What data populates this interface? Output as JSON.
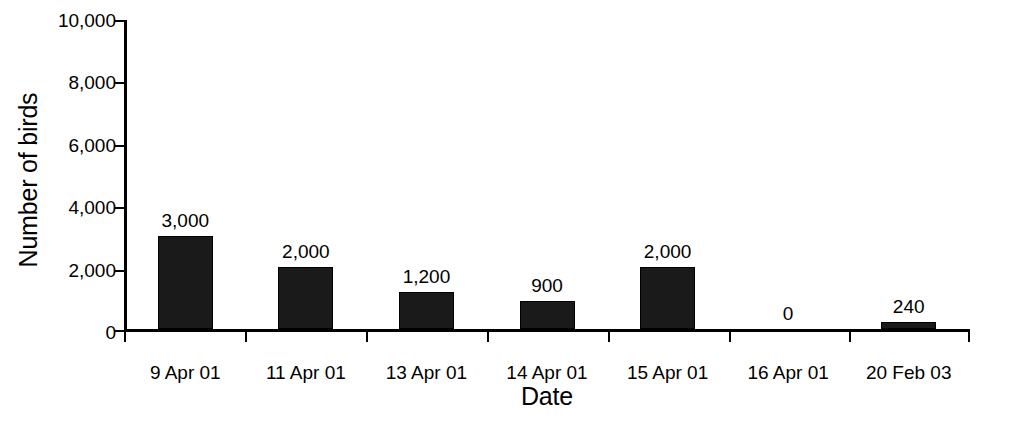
{
  "chart_data": {
    "type": "bar",
    "title": "",
    "xlabel": "Date",
    "ylabel": "Number of birds",
    "categories": [
      "9 Apr 01",
      "11 Apr 01",
      "13 Apr 01",
      "14 Apr 01",
      "15 Apr 01",
      "16 Apr 01",
      "20 Feb 03"
    ],
    "values": [
      3000,
      2000,
      1200,
      900,
      2000,
      0,
      240
    ],
    "data_labels": [
      "3,000",
      "2,000",
      "1,200",
      "900",
      "2,000",
      "0",
      "240"
    ],
    "ylim": [
      0,
      10000
    ],
    "ytick_values": [
      0,
      2000,
      4000,
      6000,
      8000,
      10000
    ],
    "ytick_labels": [
      "0",
      "2,000",
      "4,000",
      "6,000",
      "8,000",
      "10,000"
    ],
    "grid": false,
    "legend": false,
    "bar_color": "#1a1a1a",
    "axis_color": "#000000",
    "background_color": "#ffffff"
  }
}
